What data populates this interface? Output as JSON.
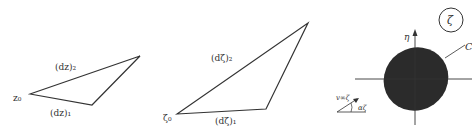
{
  "figure": {
    "panel_z": {
      "origin_label": "z₀",
      "edge1_label": "(dz)₁",
      "edge2_label": "(dz)₂"
    },
    "panel_zeta": {
      "origin_label": "ζ₀",
      "edge1_label": "(dζ)₁",
      "edge2_label": "(dζ)₂"
    },
    "panel_plane": {
      "plane_label": "ζ",
      "axis_label_eta": "η",
      "contour_label": "C",
      "velocity_label": "v∞ζ",
      "angle_label": "αζ"
    }
  },
  "colors": {
    "stroke": "#333333",
    "fill_body": "#2b2b2b"
  }
}
